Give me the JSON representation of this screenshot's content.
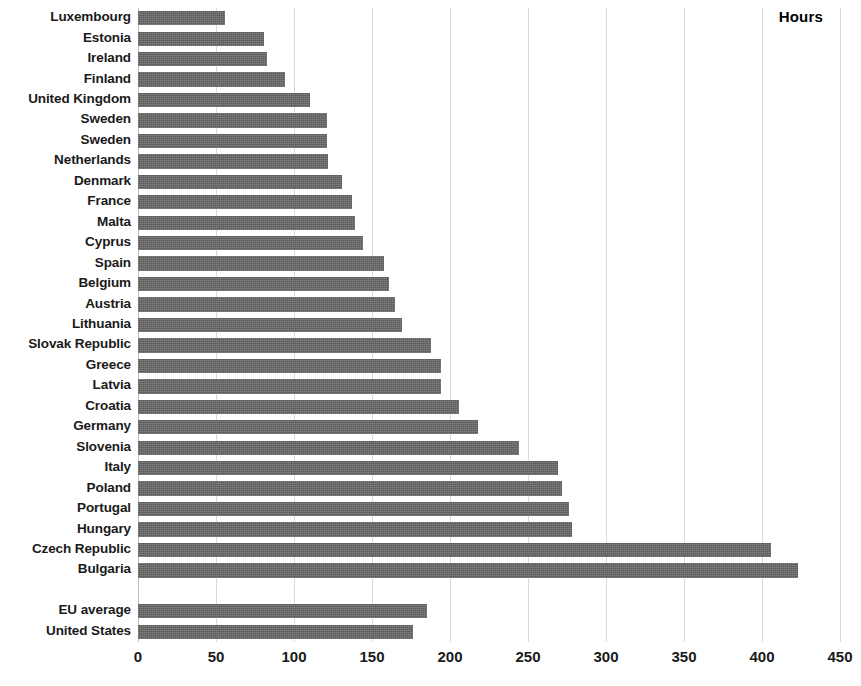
{
  "chart_data": {
    "type": "bar",
    "orientation": "horizontal",
    "title": "",
    "axis_title": "Hours",
    "xlabel": "Hours",
    "ylabel": "",
    "xlim": [
      0,
      450
    ],
    "xticks": [
      0,
      50,
      100,
      150,
      200,
      250,
      300,
      350,
      400,
      450
    ],
    "xtick_labels": [
      "0",
      "50",
      "100",
      "150",
      "200",
      "250",
      "300",
      "350",
      "400",
      "450"
    ],
    "grid": true,
    "legend": "none",
    "bar_color": "#595959",
    "grid_color": "#d9d9d9",
    "categories": [
      "Luxembourg",
      "Estonia",
      "Ireland",
      "Finland",
      "United Kingdom",
      "Sweden",
      "Sweden",
      "Netherlands",
      "Denmark",
      "France",
      "Malta",
      "Cyprus",
      "Spain",
      "Belgium",
      "Austria",
      "Lithuania",
      "Slovak Republic",
      "Greece",
      "Latvia",
      "Croatia",
      "Germany",
      "Slovenia",
      "Italy",
      "Poland",
      "Portugal",
      "Hungary",
      "Czech Republic",
      "Bulgaria",
      "",
      "EU average",
      "United States"
    ],
    "values": [
      56,
      81,
      83,
      94,
      110,
      121,
      121,
      122,
      131,
      137,
      139,
      144,
      158,
      161,
      165,
      169,
      188,
      194,
      194,
      206,
      218,
      244,
      269,
      272,
      276,
      278,
      406,
      423,
      null,
      185,
      176
    ],
    "series": [
      {
        "name": "Hours",
        "values": [
          56,
          81,
          83,
          94,
          110,
          121,
          121,
          122,
          131,
          137,
          139,
          144,
          158,
          161,
          165,
          169,
          188,
          194,
          194,
          206,
          218,
          244,
          269,
          272,
          276,
          278,
          406,
          423,
          null,
          185,
          176
        ]
      }
    ]
  }
}
